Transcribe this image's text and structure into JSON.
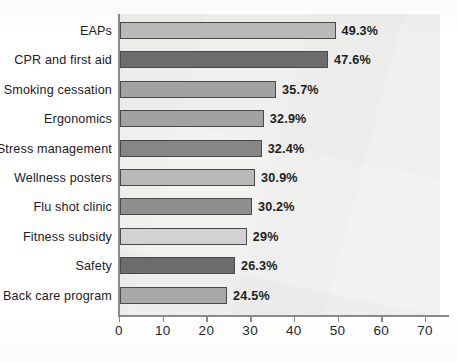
{
  "chart_data": {
    "type": "bar",
    "orientation": "horizontal",
    "title": "",
    "xlabel": "",
    "ylabel": "",
    "xlim": [
      0,
      70
    ],
    "xticks": [
      0,
      10,
      20,
      30,
      40,
      50,
      60,
      70
    ],
    "xtick_labels": [
      "0",
      "10",
      "20",
      "30",
      "40",
      "50",
      "60",
      "70"
    ],
    "grid": false,
    "legend": null,
    "categories": [
      "EAPs",
      "CPR and first aid",
      "Smoking cessation",
      "Ergonomics",
      "Stress management",
      "Wellness posters",
      "Flu shot clinic",
      "Fitness subsidy",
      "Safety",
      "Back care program"
    ],
    "values": [
      49.3,
      47.6,
      35.7,
      32.9,
      32.4,
      30.9,
      30.2,
      29,
      26.3,
      24.5
    ],
    "value_labels": [
      "49.3%",
      "47.6%",
      "35.7%",
      "32.9%",
      "32.4%",
      "30.9%",
      "30.2%",
      "29%",
      "26.3%",
      "24.5%"
    ],
    "bar_colors": [
      "#b9b9b9",
      "#6c6c6c",
      "#a2a2a2",
      "#a2a2a2",
      "#868686",
      "#b9b9b9",
      "#8f8f8f",
      "#d2d2d2",
      "#6c6c6c",
      "#a8a8a8"
    ],
    "bar_edge_color": "#4a4a4a",
    "plot_background": "#f2f2f0",
    "axis_color": "#8a8a8a"
  }
}
